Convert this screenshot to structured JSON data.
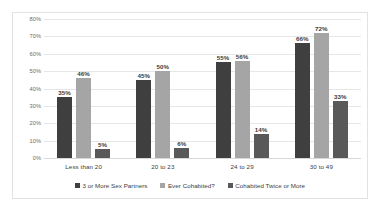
{
  "chart_data": {
    "type": "bar",
    "title": "",
    "subtitle": "",
    "xlabel": "",
    "ylabel": "",
    "ylim": [
      0,
      80
    ],
    "y_ticks": [
      "0%",
      "10%",
      "20%",
      "30%",
      "40%",
      "50%",
      "60%",
      "70%",
      "80%"
    ],
    "grid": true,
    "legend_position": "bottom",
    "categories": [
      "Less than 20",
      "20 to 23",
      "24 to 29",
      "30 to 49"
    ],
    "series": [
      {
        "name": "3 or More Sex Partners",
        "color": "#3f3f3f",
        "values": [
          35,
          45,
          55,
          66
        ],
        "labels": [
          "35%",
          "45%",
          "55%",
          "66%"
        ]
      },
      {
        "name": "Ever Cohabited?",
        "color": "#a5a5a5",
        "values": [
          46,
          50,
          56,
          72
        ],
        "labels": [
          "46%",
          "50%",
          "56%",
          "72%"
        ]
      },
      {
        "name": "Cohabited Twice or More",
        "color": "#595959",
        "values": [
          5,
          6,
          14,
          33
        ],
        "labels": [
          "5%",
          "6%",
          "14%",
          "33%"
        ]
      }
    ]
  }
}
